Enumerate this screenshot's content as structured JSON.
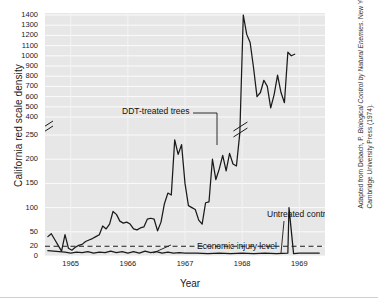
{
  "chart_data": {
    "type": "line",
    "title": "",
    "xlabel": "Year",
    "ylabel": "California red scale density",
    "xlim": [
      1964.55,
      1969.45
    ],
    "ylim": [
      0,
      1400
    ],
    "grid": true,
    "legend_position": "inline-annotations",
    "axis_break": {
      "present": true,
      "between": [
        250,
        400
      ],
      "marker": "double-slash"
    },
    "y_ticks": [
      0,
      20,
      50,
      100,
      150,
      200,
      250,
      400,
      500,
      600,
      700,
      800,
      900,
      1000,
      1100,
      1200,
      1300,
      1400
    ],
    "y_tick_labels": [
      "0",
      "20",
      "50",
      "100",
      "150",
      "200",
      "250",
      "400",
      "500",
      "600",
      "700",
      "800",
      "900",
      "1000",
      "1100",
      "1200",
      "1300",
      "1400"
    ],
    "x_ticks": [
      1965,
      1966,
      1967,
      1968,
      1969
    ],
    "x_tick_labels": [
      "1965",
      "1966",
      "1967",
      "1968",
      "1969"
    ],
    "annotations": [
      {
        "text": "DDT-treated trees",
        "target_x": 1967.62,
        "target_y": 600
      },
      {
        "text": "Untreated control trees",
        "target_x": 1968.82,
        "target_y": 8
      },
      {
        "text": "Economic injury level",
        "target_x": 1966.05,
        "target_y": 20
      }
    ],
    "reference_line": {
      "name": "Economic injury level",
      "value": 20,
      "style": "dashed"
    },
    "series": [
      {
        "name": "DDT-treated trees",
        "color": "#1a1a1a",
        "x": [
          1964.6,
          1964.66,
          1964.72,
          1964.78,
          1964.84,
          1964.9,
          1964.96,
          1965.02,
          1965.08,
          1965.14,
          1965.2,
          1965.26,
          1965.32,
          1965.38,
          1965.44,
          1965.5,
          1965.56,
          1965.62,
          1965.68,
          1965.74,
          1965.8,
          1965.86,
          1965.92,
          1965.98,
          1966.04,
          1966.1,
          1966.16,
          1966.22,
          1966.28,
          1966.34,
          1966.4,
          1966.46,
          1966.52,
          1966.58,
          1966.64,
          1966.7,
          1966.76,
          1966.82,
          1966.88,
          1966.94,
          1967.0,
          1967.06,
          1967.12,
          1967.18,
          1967.24,
          1967.3,
          1967.36,
          1967.42,
          1967.48,
          1967.54,
          1967.6,
          1967.66,
          1967.72,
          1967.78,
          1967.84,
          1967.9,
          1967.96,
          1968.02,
          1968.08,
          1968.14,
          1968.2,
          1968.26,
          1968.32,
          1968.38,
          1968.44,
          1968.5,
          1968.56,
          1968.62,
          1968.68,
          1968.74,
          1968.8,
          1968.86,
          1968.92
        ],
        "y": [
          40,
          46,
          34,
          22,
          10,
          44,
          16,
          12,
          18,
          22,
          24,
          30,
          33,
          36,
          40,
          44,
          62,
          56,
          66,
          92,
          86,
          72,
          68,
          70,
          66,
          56,
          54,
          58,
          60,
          76,
          78,
          76,
          52,
          70,
          108,
          130,
          126,
          240,
          210,
          230,
          150,
          104,
          100,
          96,
          74,
          66,
          110,
          112,
          200,
          158,
          180,
          208,
          176,
          212,
          190,
          186,
          270,
          1400,
          1210,
          1130,
          880,
          600,
          640,
          760,
          700,
          490,
          620,
          810,
          640,
          540,
          1035,
          1000,
          1015
        ],
        "note": "Values between 250 and 400 are compressed by the axis break; the line carries a break marker near 1967.97."
      },
      {
        "name": "Untreated control trees",
        "color": "#1a1a1a",
        "x": [
          1964.6,
          1964.7,
          1964.8,
          1964.9,
          1965.0,
          1965.1,
          1965.2,
          1965.3,
          1965.4,
          1965.5,
          1965.6,
          1965.7,
          1965.8,
          1965.9,
          1966.0,
          1966.1,
          1966.2,
          1966.3,
          1966.4,
          1966.5,
          1966.6,
          1966.7,
          1966.8,
          1966.9,
          1967.0,
          1967.2,
          1967.4,
          1967.6,
          1967.8,
          1968.0,
          1968.2,
          1968.4,
          1968.6,
          1968.8,
          1968.82,
          1968.9,
          1969.0,
          1969.2,
          1969.35
        ],
        "y": [
          11,
          10,
          9,
          8,
          6,
          8,
          7,
          9,
          6,
          8,
          7,
          10,
          7,
          9,
          6,
          9,
          6,
          10,
          7,
          9,
          6,
          8,
          6,
          7,
          6,
          6,
          5,
          6,
          5,
          6,
          5,
          6,
          5,
          6,
          100,
          5,
          6,
          6,
          6
        ],
        "note": "Remains below the economic injury level of 20 throughout; the vertical excursion near 1968.82 is the annotation leader line."
      }
    ]
  },
  "figure": {
    "credit_line_1": "Adapted from Debach, P. Biological Control by Natural Enemies.",
    "credit_line_2": "New York: Cambridge University Press (1974).",
    "credit_prefix": "Adapted from Debach, P. ",
    "credit_italic": "Biological Control by Natural Enemies",
    "credit_suffix": ". New York: Cambridge University Press (1974)."
  }
}
